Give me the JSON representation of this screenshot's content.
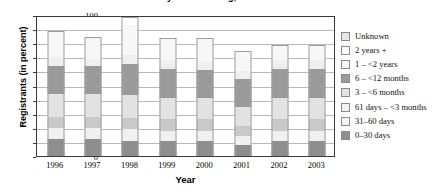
{
  "chart": {
    "title": "of Calendar Year by Time Waiting, 1996–2003",
    "ylabel": "Registrants (in percent)",
    "xlabel": "Year"
  },
  "chart_data": {
    "type": "bar",
    "subtype": "stacked-bar",
    "title": "of Calendar Year by Time Waiting, 1996–2003",
    "xlabel": "Year",
    "ylabel": "Registrants (in percent)",
    "ylim": [
      0,
      100
    ],
    "yticks": [
      0,
      10,
      20,
      30,
      40,
      50,
      60,
      70,
      80,
      90,
      100
    ],
    "grid": true,
    "legend_position": "right",
    "categories": [
      "1996",
      "1997",
      "1998",
      "1999",
      "2000",
      "2001",
      "2002",
      "2003"
    ],
    "series": [
      {
        "name": "0–30 days",
        "color": "#8e8e8e",
        "values": [
          12,
          12,
          11,
          11,
          11,
          8,
          11,
          11
        ]
      },
      {
        "name": "31–60 days",
        "color": "#f0f0f0",
        "values": [
          8,
          8,
          8,
          7,
          7,
          6,
          7,
          7
        ]
      },
      {
        "name": "61 days – <3 months",
        "color": "#c9c9c9",
        "values": [
          8,
          8,
          8,
          8,
          8,
          7,
          8,
          8
        ]
      },
      {
        "name": "3 – <6 months",
        "color": "#e2e2e2",
        "values": [
          16,
          16,
          16,
          15,
          15,
          14,
          15,
          15
        ]
      },
      {
        "name": "6 – <12 months",
        "color": "#9a9a9a",
        "values": [
          20,
          20,
          22,
          21,
          20,
          20,
          21,
          21
        ]
      },
      {
        "name": "1 – <2 years",
        "color": "#efefef",
        "values": [
          6,
          5,
          7,
          6,
          6,
          5,
          6,
          6
        ]
      },
      {
        "name": "2 years +",
        "color": "#f7f7f7",
        "values": [
          18,
          15,
          21,
          15,
          16,
          14,
          10,
          10
        ]
      },
      {
        "name": "Unknown",
        "color": "#ffffff",
        "values": [
          0,
          0,
          5,
          0,
          0,
          0,
          0,
          0
        ]
      }
    ],
    "totals": [
      88,
      84,
      98,
      83,
      83,
      74,
      78,
      78
    ]
  },
  "legend": {
    "items": [
      {
        "label": "Unknown",
        "color": "#e8e8e8"
      },
      {
        "label": "2 years +",
        "color": "#ffffff"
      },
      {
        "label": "1 – <2 years",
        "color": "#f6f6f6"
      },
      {
        "label": "6 – <12 months",
        "color": "#9a9a9a"
      },
      {
        "label": "3 – <6 months",
        "color": "#e2e2e2"
      },
      {
        "label": "61 days – <3 months",
        "color": "#f2f2f2"
      },
      {
        "label": "31–60 days",
        "color": "#f7f7f7"
      },
      {
        "label": "0–30 days",
        "color": "#8e8e8e"
      }
    ]
  }
}
